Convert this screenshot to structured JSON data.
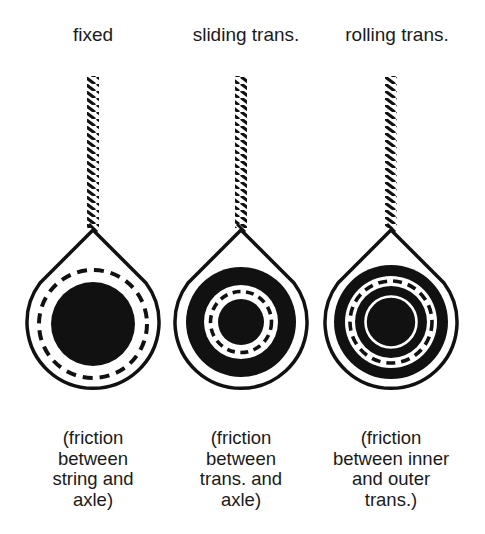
{
  "diagram": {
    "panels": [
      {
        "id": "fixed",
        "title": "fixed",
        "caption_lines": [
          "(friction",
          "between",
          "string and",
          "axle)"
        ],
        "center_x": 93
      },
      {
        "id": "sliding",
        "title": "sliding trans.",
        "caption_lines": [
          "(friction",
          "between",
          "trans. and",
          "axle)"
        ],
        "center_x": 241
      },
      {
        "id": "rolling",
        "title": "rolling trans.",
        "caption_lines": [
          "(friction",
          "between inner",
          "and outer",
          "trans.)"
        ],
        "center_x": 391
      }
    ],
    "colors": {
      "ink": "#111111",
      "paper": "#ffffff"
    }
  }
}
